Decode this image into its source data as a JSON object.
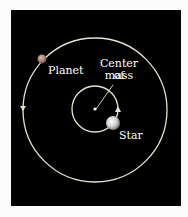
{
  "diagram": {
    "labels": {
      "planet": "Planet",
      "center_of_mass": "Center of mass",
      "center_line1": "Center of",
      "center_line2": "mass",
      "star": "Star"
    },
    "colors": {
      "background": "#000000",
      "orbit": "#e8e2d0",
      "text": "#ffffff"
    }
  }
}
